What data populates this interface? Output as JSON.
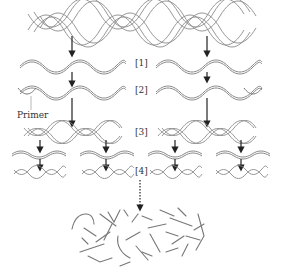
{
  "diagram": {
    "type": "pcr-amplification",
    "colors": {
      "strand": "#8a8a8a",
      "arrow": "#222222",
      "text": "#333333"
    },
    "labels": {
      "step1": "[1]",
      "step2": "[2]",
      "step3": "[3]",
      "step4": "[4]",
      "primer": "Primer"
    },
    "stages": [
      {
        "id": "template",
        "description": "double-stranded DNA template (twisted helix)"
      },
      {
        "id": "step1",
        "label": "[1]",
        "description": "denatured single strands"
      },
      {
        "id": "step2",
        "label": "[2]",
        "description": "primers annealed to strands"
      },
      {
        "id": "step3",
        "label": "[3]",
        "description": "extended double-stranded copies"
      },
      {
        "id": "step4",
        "label": "[4]",
        "description": "repeated cycles producing more copies"
      },
      {
        "id": "product",
        "description": "many amplified DNA fragments"
      }
    ]
  }
}
